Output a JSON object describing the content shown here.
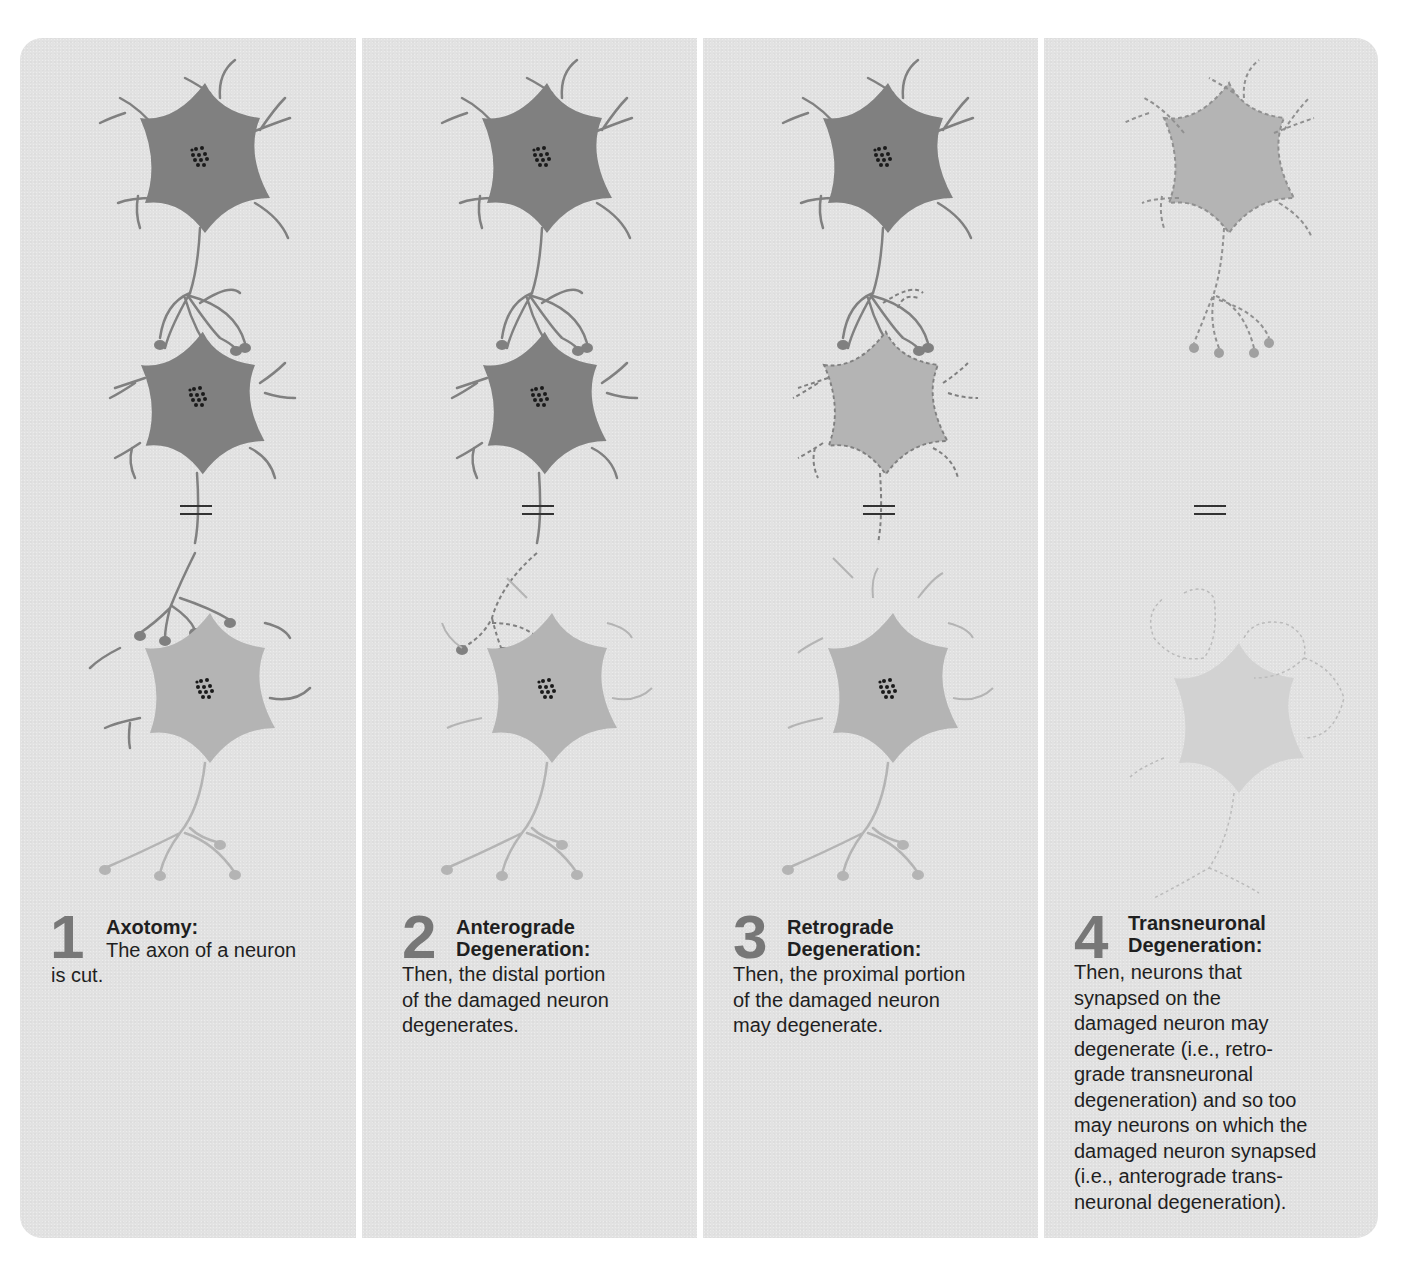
{
  "figure": {
    "background_color": "#e2e2e2",
    "neuron_dark_color": "#808080",
    "neuron_light_color": "#b4b4b4",
    "nucleus_color": "#1a1a1a",
    "number_color": "#777777",
    "panels": [
      {
        "number": "1",
        "title_line1": "Axotomy:",
        "title_line2": "",
        "body_first_line": "The axon of a neuron",
        "body_rest": "is cut."
      },
      {
        "number": "2",
        "title_line1": "Anterograde",
        "title_line2": "Degeneration:",
        "body_lines": [
          "Then, the distal portion",
          "of the damaged neuron",
          "degenerates."
        ]
      },
      {
        "number": "3",
        "title_line1": "Retrograde",
        "title_line2": "Degeneration:",
        "body_lines": [
          "Then, the proximal portion",
          "of the damaged neuron",
          "may degenerate."
        ]
      },
      {
        "number": "4",
        "title_line1": "Transneuronal",
        "title_line2": "Degeneration:",
        "body_lines": [
          "Then, neurons that",
          "synapsed on the",
          "damaged neuron may",
          "degenerate (i.e., retro-",
          "grade transneuronal",
          "degeneration) and so too",
          "may neurons on which the",
          "damaged neuron synapsed",
          "(i.e., anterograde trans-",
          "neuronal degeneration)."
        ]
      }
    ]
  }
}
